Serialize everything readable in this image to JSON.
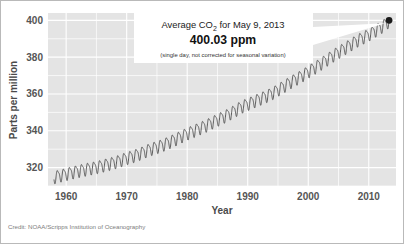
{
  "figure": {
    "credit": "Credit: NOAA/Scripps Institution of Oceanography"
  },
  "annotation": {
    "line1_prefix": "Average CO",
    "line1_sub": "2",
    "line1_suffix": " for May 9, 2013",
    "value": "400.03 ppm",
    "note": "(single day, not corrected for seasonal variation)",
    "box_color": "#ffffff",
    "marker_color": "#1a1a1a"
  },
  "chart_data": {
    "type": "line",
    "title": "",
    "xlabel": "Year",
    "ylabel": "Parts per million",
    "xlim": [
      1957,
      2014.5
    ],
    "ylim": [
      310,
      404
    ],
    "xticks": [
      1960,
      1970,
      1980,
      1990,
      2000,
      2010
    ],
    "yticks": [
      320,
      340,
      360,
      380,
      400
    ],
    "y_minor_step": 10,
    "grid": true,
    "grid_color": "#ffffff",
    "plot_bg": "#e4e4e4",
    "line_color": "#4c4c4c",
    "legend": null,
    "series_name": "Atmospheric CO2 (Mauna Loa monthly mean)",
    "seasonal_amplitude_ppm": 3.1,
    "annotations": [
      {
        "x": 2013.35,
        "y": 400.03,
        "label": "400.03 ppm",
        "marker": "dot"
      }
    ],
    "x": [
      1958.0,
      1958.5,
      1959.0,
      1959.5,
      1960.0,
      1960.5,
      1961.0,
      1961.5,
      1962.0,
      1962.5,
      1963.0,
      1963.5,
      1964.0,
      1964.5,
      1965.0,
      1965.5,
      1966.0,
      1966.5,
      1967.0,
      1967.5,
      1968.0,
      1968.5,
      1969.0,
      1969.5,
      1970.0,
      1970.5,
      1971.0,
      1971.5,
      1972.0,
      1972.5,
      1973.0,
      1973.5,
      1974.0,
      1974.5,
      1975.0,
      1975.5,
      1976.0,
      1976.5,
      1977.0,
      1977.5,
      1978.0,
      1978.5,
      1979.0,
      1979.5,
      1980.0,
      1980.5,
      1981.0,
      1981.5,
      1982.0,
      1982.5,
      1983.0,
      1983.5,
      1984.0,
      1984.5,
      1985.0,
      1985.5,
      1986.0,
      1986.5,
      1987.0,
      1987.5,
      1988.0,
      1988.5,
      1989.0,
      1989.5,
      1990.0,
      1990.5,
      1991.0,
      1991.5,
      1992.0,
      1992.5,
      1993.0,
      1993.5,
      1994.0,
      1994.5,
      1995.0,
      1995.5,
      1996.0,
      1996.5,
      1997.0,
      1997.5,
      1998.0,
      1998.5,
      1999.0,
      1999.5,
      2000.0,
      2000.5,
      2001.0,
      2001.5,
      2002.0,
      2002.5,
      2003.0,
      2003.5,
      2004.0,
      2004.5,
      2005.0,
      2005.5,
      2006.0,
      2006.5,
      2007.0,
      2007.5,
      2008.0,
      2008.5,
      2009.0,
      2009.5,
      2010.0,
      2010.5,
      2011.0,
      2011.5,
      2012.0,
      2012.5,
      2013.0,
      2013.35
    ],
    "y_trend": [
      315.0,
      315.5,
      315.9,
      316.3,
      316.8,
      317.2,
      317.6,
      318.0,
      318.4,
      318.8,
      319.1,
      319.5,
      319.8,
      320.1,
      320.5,
      320.9,
      321.3,
      321.8,
      322.2,
      322.6,
      323.1,
      323.6,
      324.2,
      324.8,
      325.4,
      325.9,
      326.4,
      327.0,
      327.6,
      328.3,
      329.0,
      329.7,
      330.3,
      330.9,
      331.4,
      332.0,
      332.6,
      333.3,
      334.0,
      334.8,
      335.5,
      336.3,
      337.1,
      337.9,
      338.7,
      339.4,
      340.1,
      340.8,
      341.5,
      342.2,
      342.9,
      343.7,
      344.6,
      345.4,
      346.2,
      347.0,
      347.8,
      348.6,
      349.5,
      350.4,
      351.4,
      352.4,
      353.3,
      354.1,
      354.8,
      355.5,
      356.2,
      356.9,
      357.6,
      358.3,
      359.0,
      359.8,
      360.6,
      361.5,
      362.5,
      363.5,
      364.5,
      365.5,
      366.5,
      367.5,
      368.4,
      369.3,
      370.3,
      371.3,
      372.4,
      373.4,
      374.4,
      375.4,
      376.5,
      377.6,
      378.7,
      379.8,
      380.9,
      382.0,
      383.0,
      384.0,
      385.0,
      386.0,
      387.0,
      388.1,
      389.1,
      390.0,
      390.8,
      391.6,
      392.5,
      393.5,
      394.5,
      395.5,
      396.5,
      397.6,
      398.7,
      400.03
    ]
  }
}
